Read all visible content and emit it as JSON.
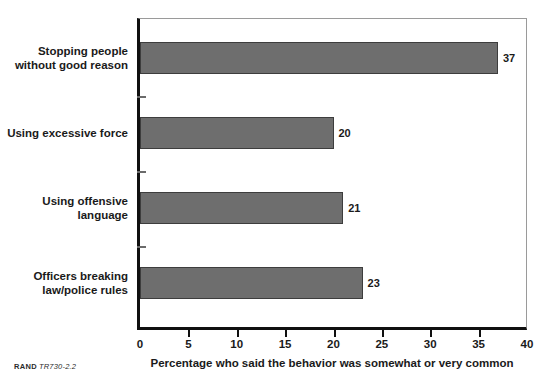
{
  "chart_data": {
    "type": "bar",
    "orientation": "horizontal",
    "title": "",
    "xlabel": "Percentage who said the behavior was somewhat or very common",
    "ylabel": "",
    "categories": [
      "Stopping people without good reason",
      "Using excessive force",
      "Using offensive language",
      "Officers breaking law/police rules"
    ],
    "category_lines": [
      [
        "Stopping people",
        "without good reason"
      ],
      [
        "Using excessive force"
      ],
      [
        "Using offensive",
        "language"
      ],
      [
        "Officers breaking",
        "law/police rules"
      ]
    ],
    "values": [
      37,
      20,
      21,
      23
    ],
    "value_labels": [
      "37",
      "20",
      "21",
      "23"
    ],
    "xlim": [
      0,
      40
    ],
    "xticks": [
      0,
      5,
      10,
      15,
      20,
      25,
      30,
      35,
      40
    ],
    "xtick_labels": [
      "0",
      "5",
      "10",
      "15",
      "20",
      "25",
      "30",
      "35",
      "40"
    ],
    "grid": false,
    "legend": null,
    "bar_color": "#6e6e6e",
    "bar_edge_color": "#3d3d3d",
    "axis_color": "#101010",
    "frame_color": "#9a9a9a"
  },
  "footer": {
    "rand_label": "RAND",
    "report_id": "TR730-2.2"
  }
}
